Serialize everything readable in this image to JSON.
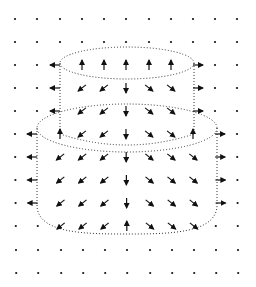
{
  "diagram": {
    "colors": {
      "background": "#ffffff",
      "ink": "#111111",
      "outline": "#333333"
    },
    "grid": {
      "cols_x": [
        15,
        37,
        60,
        82,
        104,
        126,
        149,
        171,
        193,
        215,
        237
      ],
      "rows_y": [
        19,
        42,
        65,
        88,
        111,
        134,
        157,
        180,
        203,
        226,
        250,
        273
      ],
      "cells": [
        [
          "o",
          "o",
          "o",
          "o",
          "o",
          "o",
          "o",
          "o",
          "o",
          "o",
          "o"
        ],
        [
          "o",
          "o",
          "o",
          "o",
          "o",
          "o",
          "o",
          "o",
          "o",
          "o",
          "o"
        ],
        [
          "o",
          "o",
          "L",
          "U",
          "U",
          "U",
          "U",
          "U",
          "R",
          "o",
          "o"
        ],
        [
          "o",
          "o",
          "L",
          "SW",
          "SW",
          "D",
          "SE",
          "SE",
          "R",
          "o",
          "o"
        ],
        [
          "o",
          "o",
          "L",
          "SW",
          "SW",
          "D",
          "SE",
          "SE",
          "R",
          "o",
          "o"
        ],
        [
          "o",
          "L",
          "U",
          "SW",
          "SW",
          "D",
          "SE",
          "SE",
          "U",
          "R",
          "o"
        ],
        [
          "o",
          "L",
          "SW",
          "SW",
          "SW",
          "D",
          "SE",
          "SE",
          "SE",
          "R",
          "o"
        ],
        [
          "o",
          "L",
          "SW",
          "SW",
          "SW",
          "D",
          "SE",
          "SE",
          "SE",
          "R",
          "o"
        ],
        [
          "o",
          "L",
          "SW",
          "SW",
          "SW",
          "D",
          "SE",
          "SE",
          "SE",
          "R",
          "o"
        ],
        [
          "o",
          "o",
          "SW",
          "SW",
          "SW",
          "U",
          "SE",
          "SE",
          "SE",
          "o",
          "o"
        ],
        [
          "o",
          "o",
          "o",
          "o",
          "o",
          "o",
          "o",
          "o",
          "o",
          "o",
          "o"
        ],
        [
          "o",
          "o",
          "o",
          "o",
          "o",
          "o",
          "o",
          "o",
          "o",
          "o",
          "o"
        ]
      ],
      "legend": {
        "o": "dot (zero vector)",
        "L": "arrow-left",
        "R": "arrow-right",
        "U": "arrow-up",
        "D": "arrow-down",
        "SW": "arrow-down-left",
        "SE": "arrow-down-right"
      }
    },
    "shapes": {
      "upper_cylinder": {
        "cx": 127,
        "top_cy": 63,
        "rx": 67,
        "ry": 16,
        "bottom_y": 134
      },
      "lower_cylinder": {
        "cx": 127,
        "top_cy": 128,
        "rx": 90,
        "ry": 24,
        "bottom_y": 205,
        "bottom_arc_y": 234
      }
    }
  }
}
